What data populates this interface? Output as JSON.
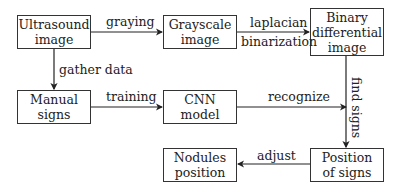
{
  "nodes": {
    "ultrasound": {
      "line1": "Ultrasound",
      "line2": "image"
    },
    "grayscale": {
      "line1": "Grayscale",
      "line2": "image"
    },
    "binary": {
      "line1": "Binary",
      "line2": "differential",
      "line3": "image"
    },
    "manual": {
      "line1": "Manual",
      "line2": "signs"
    },
    "cnn": {
      "line1": "CNN",
      "line2": "model"
    },
    "nodules": {
      "line1": "Nodules",
      "line2": "position"
    },
    "position": {
      "line1": "Position",
      "line2": "of signs"
    }
  },
  "edges": {
    "graying": "graying",
    "laplacian": "laplacian",
    "binarization": "binarization",
    "gather_data": "gather data",
    "training": "training",
    "recognize": "recognize",
    "find_signs": "find signs",
    "adjust": "adjust"
  }
}
